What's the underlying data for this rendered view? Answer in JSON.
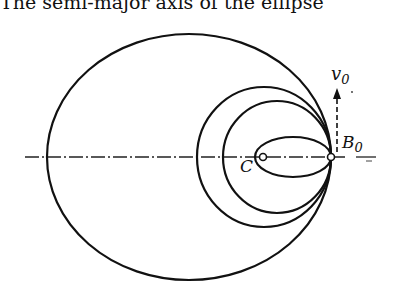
{
  "caption": "The semi-major axis of the ellipse",
  "figure": {
    "labels": {
      "velocity": "v",
      "velocity_sub": "0",
      "point_b": "B",
      "point_b_sub": "0",
      "center": "C"
    },
    "orbits": [
      {
        "name": "largest-ellipse",
        "cx": 189,
        "cy": 157,
        "rx": 142,
        "ry": 123
      },
      {
        "name": "second-ellipse",
        "cx": 264,
        "cy": 157,
        "rx": 67,
        "ry": 70
      },
      {
        "name": "third-ellipse",
        "cx": 277,
        "cy": 157,
        "rx": 54,
        "ry": 56
      },
      {
        "name": "smallest-ellipse",
        "cx": 293,
        "cy": 157,
        "rx": 38,
        "ry": 20
      }
    ],
    "colors": {
      "ink": "#111111",
      "background": "#ffffff"
    }
  }
}
